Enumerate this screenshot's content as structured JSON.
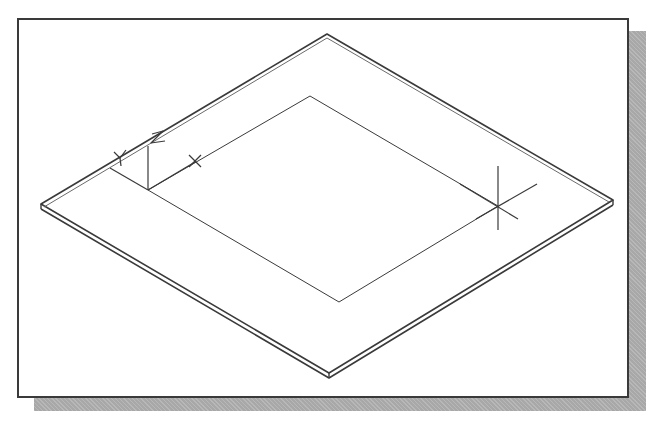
{
  "diagram": {
    "type": "isometric-cad-viewport",
    "colors": {
      "background": "#ffffff",
      "frame_border": "#3a3a3a",
      "shadow": "#a8a8a8",
      "lines": "#3a3a3a"
    },
    "plate_outer": {
      "top": [
        327,
        34
      ],
      "right": [
        613,
        203
      ],
      "bottom": [
        329,
        378
      ],
      "left": [
        41,
        207
      ],
      "thickness": 5
    },
    "inner_rectangle": {
      "points": [
        [
          148,
          190
        ],
        [
          310,
          96
        ],
        [
          498,
          206
        ],
        [
          339,
          302
        ]
      ]
    },
    "ucs_icon": {
      "origin": [
        148,
        190
      ],
      "labels": {
        "x": "X",
        "y": "Y",
        "z": "Z"
      }
    },
    "crosshair": {
      "center": [
        498,
        206
      ]
    }
  }
}
